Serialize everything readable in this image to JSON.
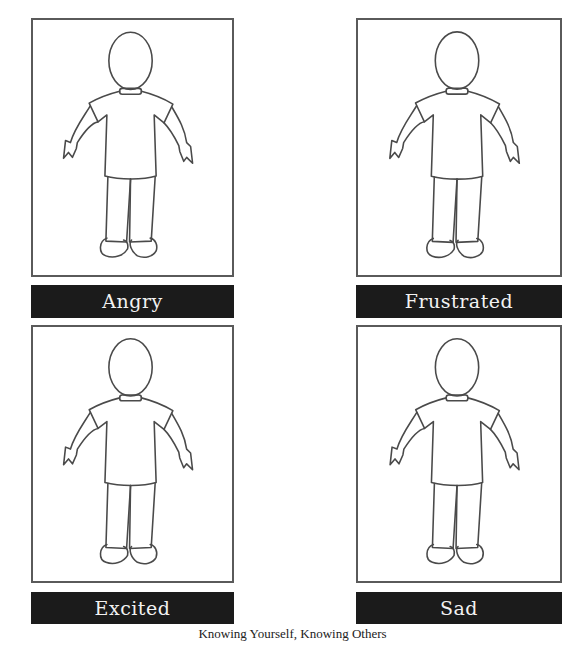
{
  "cards": [
    {
      "label": "Angry"
    },
    {
      "label": "Frustrated"
    },
    {
      "label": "Excited"
    },
    {
      "label": "Sad"
    }
  ],
  "figure": {
    "icon": "person-outline-icon"
  },
  "colors": {
    "label_bar_background": "#1b1b1b",
    "label_text": "#f2f2f2",
    "frame_border": "#5a5a5a",
    "figure_stroke": "#4a4a4a"
  },
  "footer": {
    "text": "Knowing Yourself, Knowing Others"
  }
}
